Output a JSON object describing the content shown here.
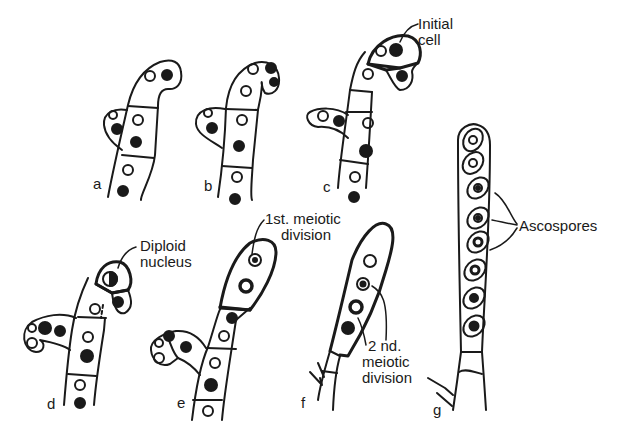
{
  "diagram": {
    "type": "biological-illustration",
    "stage_labels": [
      "a",
      "b",
      "c",
      "d",
      "e",
      "f",
      "g"
    ],
    "annotations": {
      "initial_cell": "Initial\ncell",
      "initial_cell_line1": "Initial",
      "initial_cell_line2": "cell",
      "diploid_nucleus_line1": "Diploid",
      "diploid_nucleus_line2": "nucleus",
      "first_meiotic_line1": "1st. meiotic",
      "first_meiotic_line2": "division",
      "second_meiotic_line1": "2 nd.",
      "second_meiotic_line2": "meiotic",
      "second_meiotic_line3": "division",
      "ascospores": "Ascospores"
    },
    "colors": {
      "line": "#1a1a1a",
      "background": "#ffffff"
    }
  }
}
